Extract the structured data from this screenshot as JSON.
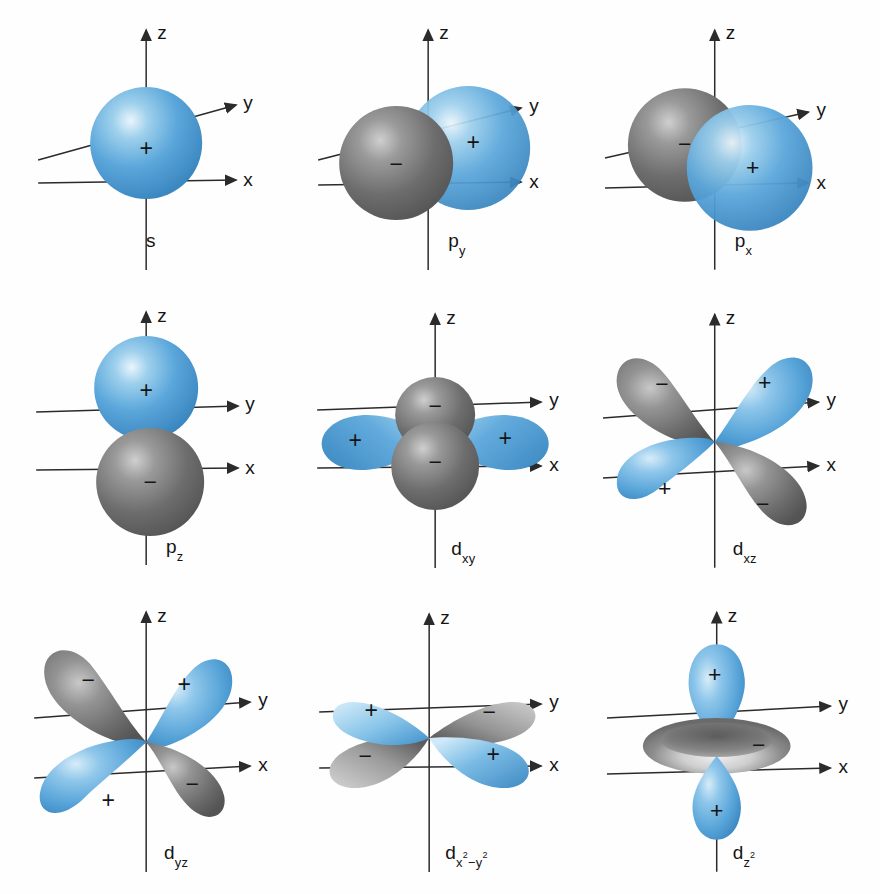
{
  "figure": {
    "background_color": "#fefefe",
    "positive_lobe_color": "#4a9fd8",
    "negative_lobe_color": "#6e6e6e",
    "axis_color": "#2b2b2b",
    "label_color": "#141414"
  },
  "axes": {
    "z_label": "z",
    "y_label": "y",
    "x_label": "x"
  },
  "signs": {
    "positive": "+",
    "negative": "−"
  },
  "panels": [
    {
      "id": "s",
      "label_html": "s",
      "type": "sphere",
      "row": 1,
      "col": 1,
      "lobes": [
        {
          "sign": "+",
          "color": "blue",
          "shape": "sphere",
          "position": "centered-on-origin"
        }
      ]
    },
    {
      "id": "p_y",
      "label_html": "p<sub>y</sub>",
      "label_base": "p",
      "label_sub": "y",
      "type": "two-sphere",
      "row": 1,
      "col": 2,
      "lobes": [
        {
          "sign": "−",
          "color": "gray",
          "shape": "sphere",
          "position": "left-along-negative-y"
        },
        {
          "sign": "+",
          "color": "blue",
          "shape": "sphere",
          "position": "right-along-positive-y"
        }
      ]
    },
    {
      "id": "p_x",
      "label_html": "p<sub>x</sub>",
      "label_base": "p",
      "label_sub": "x",
      "type": "two-sphere",
      "row": 1,
      "col": 3,
      "lobes": [
        {
          "sign": "−",
          "color": "gray",
          "shape": "sphere",
          "position": "upper-left-along-negative-x"
        },
        {
          "sign": "+",
          "color": "blue",
          "shape": "sphere",
          "position": "lower-right-along-positive-x"
        }
      ]
    },
    {
      "id": "p_z",
      "label_html": "p<sub>z</sub>",
      "label_base": "p",
      "label_sub": "z",
      "type": "two-sphere",
      "row": 2,
      "col": 1,
      "lobes": [
        {
          "sign": "+",
          "color": "blue",
          "shape": "sphere",
          "position": "above-origin-along-positive-z"
        },
        {
          "sign": "−",
          "color": "gray",
          "shape": "sphere",
          "position": "below-origin-along-negative-z"
        }
      ]
    },
    {
      "id": "d_xy",
      "label_html": "d<sub>xy</sub>",
      "label_base": "d",
      "label_sub": "xy",
      "type": "four-lobe-planar",
      "row": 2,
      "col": 2,
      "lobes": [
        {
          "sign": "+",
          "color": "blue",
          "shape": "lobe",
          "position": "left-horizontal"
        },
        {
          "sign": "+",
          "color": "blue",
          "shape": "lobe",
          "position": "right-horizontal"
        },
        {
          "sign": "−",
          "color": "gray",
          "shape": "lobe",
          "position": "center-toward-viewer-upper"
        },
        {
          "sign": "−",
          "color": "gray",
          "shape": "lobe",
          "position": "center-toward-viewer-lower"
        }
      ]
    },
    {
      "id": "d_xz",
      "label_html": "d<sub>xz</sub>",
      "label_base": "d",
      "label_sub": "xz",
      "type": "four-lobe-cloverleaf",
      "row": 2,
      "col": 3,
      "lobes": [
        {
          "sign": "−",
          "color": "gray",
          "shape": "teardrop",
          "position": "upper-left"
        },
        {
          "sign": "+",
          "color": "blue",
          "shape": "teardrop",
          "position": "upper-right"
        },
        {
          "sign": "+",
          "color": "blue",
          "shape": "teardrop",
          "position": "lower-left"
        },
        {
          "sign": "−",
          "color": "gray",
          "shape": "teardrop",
          "position": "lower-right"
        }
      ]
    },
    {
      "id": "d_yz",
      "label_html": "d<sub>yz</sub>",
      "label_base": "d",
      "label_sub": "yz",
      "type": "four-lobe-cloverleaf",
      "row": 3,
      "col": 1,
      "lobes": [
        {
          "sign": "−",
          "color": "gray",
          "shape": "teardrop",
          "position": "upper-left"
        },
        {
          "sign": "+",
          "color": "blue",
          "shape": "teardrop",
          "position": "upper-right"
        },
        {
          "sign": "+",
          "color": "blue",
          "shape": "teardrop",
          "position": "lower-left"
        },
        {
          "sign": "−",
          "color": "gray",
          "shape": "teardrop",
          "position": "lower-right"
        }
      ]
    },
    {
      "id": "d_x2_y2",
      "label_html": "d<sub>x<sup>2</sup>−y<sup>2</sup></sub>",
      "label_base": "d",
      "label_sub": "x2−y2",
      "type": "four-lobe-planar",
      "row": 3,
      "col": 2,
      "lobes": [
        {
          "sign": "+",
          "color": "blue",
          "shape": "lobe",
          "position": "upper-left-along-negative-x"
        },
        {
          "sign": "−",
          "color": "gray",
          "shape": "lobe",
          "position": "upper-right-along-positive-y"
        },
        {
          "sign": "−",
          "color": "gray",
          "shape": "lobe",
          "position": "lower-left-along-negative-y"
        },
        {
          "sign": "+",
          "color": "blue",
          "shape": "lobe",
          "position": "lower-right-along-positive-x"
        }
      ]
    },
    {
      "id": "d_z2",
      "label_html": "d<sub>z<sup>2</sup></sub>",
      "label_base": "d",
      "label_sub": "z2",
      "type": "two-lobe-with-torus",
      "row": 3,
      "col": 3,
      "lobes": [
        {
          "sign": "+",
          "color": "blue",
          "shape": "teardrop",
          "position": "above-origin-along-positive-z"
        },
        {
          "sign": "−",
          "color": "gray",
          "shape": "torus",
          "position": "equatorial-ring"
        },
        {
          "sign": "+",
          "color": "blue",
          "shape": "teardrop",
          "position": "below-origin-along-negative-z"
        }
      ]
    }
  ]
}
